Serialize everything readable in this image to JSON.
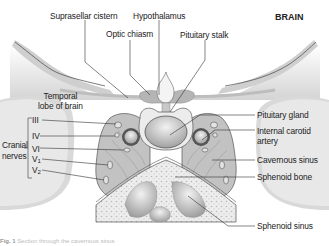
{
  "diagram": {
    "title": "BRAIN",
    "labels": {
      "suprasellar_cistern": "Suprasellar cistern",
      "hypothalamus": "Hypothalamus",
      "optic_chiasm": "Optic chiasm",
      "pituitary_stalk": "Pituitary stalk",
      "temporal_lobe_line1": "Temporal",
      "temporal_lobe_line2": "lobe of brain",
      "cranial_nerves_line1": "Cranial",
      "cranial_nerves_line2": "nerves",
      "nerve_iii": "III",
      "nerve_iv": "IV",
      "nerve_vi": "VI",
      "nerve_v1_base": "V",
      "nerve_v1_sub": "1",
      "nerve_v2_base": "V",
      "nerve_v2_sub": "2",
      "pituitary_gland": "Pituitary gland",
      "internal_carotid_line1": "Internal carotid",
      "internal_carotid_line2": "artery",
      "cavernous_sinus": "Cavernous sinus",
      "sphenoid_bone": "Sphenoid bone",
      "sphenoid_sinus": "Sphenoid sinus"
    },
    "caption": {
      "fig": "Fig. 1",
      "text": "Section through the cavernous sinus"
    },
    "colors": {
      "tissue_dark": "#b5b5b5",
      "tissue_mid": "#cfcfcf",
      "tissue_light": "#e6e6e6",
      "bone": "#ececec",
      "line": "#333333"
    }
  }
}
